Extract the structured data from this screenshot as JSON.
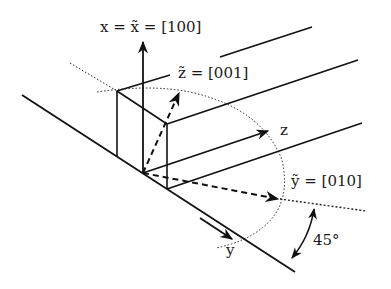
{
  "diagram": {
    "type": "crystal-orientation-axes",
    "labels": {
      "x_axis": "x = x̃ = [100]",
      "z_tilde": "z̃ = [001]",
      "y_tilde": "ỹ = [010]",
      "z": "z",
      "y": "y",
      "angle": "45°"
    },
    "colors": {
      "line": "#111111",
      "background": "#ffffff"
    }
  }
}
